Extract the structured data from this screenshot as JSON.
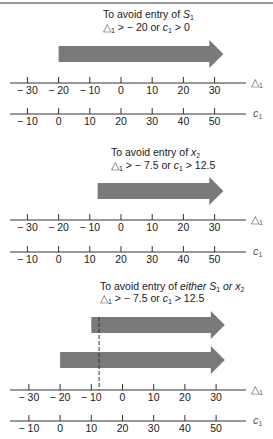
{
  "figure": {
    "panels": [
      {
        "title_line1": "To avoid entry of ",
        "title_line1_italic": "S",
        "title_line1_sub": "1",
        "title_line1_rest": "",
        "condition": {
          "delta_sym": "△",
          "delta_sub": "1",
          "op1": " >  − 20 or ",
          "c_sym": "c",
          "c_sub": "1",
          "op2": " > 0"
        },
        "arrows": [
          {
            "from_delta": -20
          }
        ],
        "dashed_at_delta": null
      },
      {
        "title_line1": "To avoid entry of ",
        "title_line1_italic": "x",
        "title_line1_sub": "2",
        "title_line1_rest": "",
        "condition": {
          "delta_sym": "△",
          "delta_sub": "1",
          "op1": " >  − 7.5 or ",
          "c_sym": "c",
          "c_sub": "1",
          "op2": " > 12.5"
        },
        "arrows": [
          {
            "from_delta": -7.5
          }
        ],
        "dashed_at_delta": null
      },
      {
        "title_line1": "To avoid entry of ",
        "title_line1_italic": "either S",
        "title_line1_sub": "1",
        "title_line1_rest": " or x",
        "title_line1_rest_sub": "2",
        "condition": {
          "delta_sym": "△",
          "delta_sub": "1",
          "op1": " >  − 7.5 or ",
          "c_sym": "c",
          "c_sub": "1",
          "op2": " > 12.5"
        },
        "arrows": [
          {
            "from_delta": -10
          },
          {
            "from_delta": -20
          }
        ],
        "dashed_at_delta": -7.5
      }
    ],
    "delta_axis": {
      "name": "△",
      "name_sub": "1",
      "ticks": [
        -30,
        -20,
        -10,
        0,
        10,
        20,
        30
      ],
      "tick_labels": [
        "− 30",
        "− 20",
        "− 10",
        "0",
        "10",
        "20",
        "30"
      ]
    },
    "c_axis": {
      "name": "c",
      "name_sub": "1",
      "ticks": [
        -10,
        0,
        10,
        20,
        30,
        40,
        50
      ],
      "tick_labels": [
        "− 10",
        "0",
        "10",
        "20",
        "30",
        "40",
        "50"
      ]
    },
    "arrow_color": "#7a7a7a",
    "line_color": "#333333"
  }
}
